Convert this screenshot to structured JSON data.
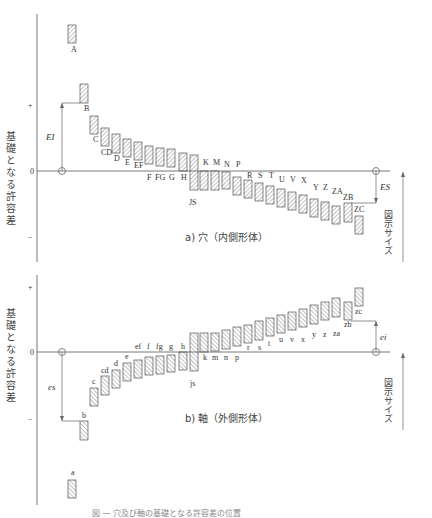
{
  "diagram": {
    "y_axis_label": "基礎となる許容差",
    "tick_plus": "+",
    "tick_zero": "0",
    "tick_minus": "−",
    "size_label": "図示サイズ",
    "caption": "図 — 穴及び軸の基礎となる許容差の位置"
  },
  "hole": {
    "title": "a) 穴（内側形体）",
    "EI": "EI",
    "ES": "ES",
    "bars": [
      {
        "label": "A",
        "x": 68,
        "y1": 25,
        "y2": 43,
        "lx": 71,
        "ly": 52
      },
      {
        "label": "B",
        "x": 80,
        "y1": 84,
        "y2": 103,
        "lx": 84,
        "ly": 111
      },
      {
        "label": "C",
        "x": 90,
        "y1": 116,
        "y2": 134,
        "lx": 93,
        "ly": 142
      },
      {
        "label": "CD",
        "x": 101,
        "y1": 128,
        "y2": 146,
        "lx": 101,
        "ly": 155
      },
      {
        "label": "D",
        "x": 112,
        "y1": 134,
        "y2": 153,
        "lx": 114,
        "ly": 161
      },
      {
        "label": "E",
        "x": 123,
        "y1": 139,
        "y2": 157,
        "lx": 125,
        "ly": 165
      },
      {
        "label": "EF",
        "x": 134,
        "y1": 142,
        "y2": 160,
        "lx": 134,
        "ly": 168
      },
      {
        "label": "F",
        "x": 145,
        "y1": 146,
        "y2": 164,
        "lx": 147,
        "ly": 180
      },
      {
        "label": "FG",
        "x": 156,
        "y1": 148,
        "y2": 166,
        "lx": 155,
        "ly": 180
      },
      {
        "label": "G",
        "x": 167,
        "y1": 149,
        "y2": 167,
        "lx": 169,
        "ly": 180
      },
      {
        "label": "H",
        "x": 179,
        "y1": 153,
        "y2": 171,
        "lx": 181,
        "ly": 180
      },
      {
        "label": "JS",
        "x": 190,
        "y1": 155,
        "y2": 190,
        "lx": 189,
        "ly": 205
      },
      {
        "label": "K",
        "x": 200,
        "y1": 171,
        "y2": 190,
        "lx": 203,
        "ly": 165
      },
      {
        "label": "M",
        "x": 211,
        "y1": 171,
        "y2": 190,
        "lx": 213,
        "ly": 165
      },
      {
        "label": "N",
        "x": 222,
        "y1": 172,
        "y2": 189,
        "lx": 224,
        "ly": 167
      },
      {
        "label": "P",
        "x": 233,
        "y1": 177,
        "y2": 195,
        "lx": 236,
        "ly": 167
      },
      {
        "label": "R",
        "x": 244,
        "y1": 180,
        "y2": 198,
        "lx": 247,
        "ly": 178
      },
      {
        "label": "S",
        "x": 255,
        "y1": 183,
        "y2": 201,
        "lx": 258,
        "ly": 178
      },
      {
        "label": "T",
        "x": 266,
        "y1": 186,
        "y2": 204,
        "lx": 269,
        "ly": 178
      },
      {
        "label": "U",
        "x": 277,
        "y1": 189,
        "y2": 207,
        "lx": 279,
        "ly": 182
      },
      {
        "label": "V",
        "x": 288,
        "y1": 192,
        "y2": 210,
        "lx": 290,
        "ly": 182
      },
      {
        "label": "X",
        "x": 299,
        "y1": 195,
        "y2": 213,
        "lx": 301,
        "ly": 183
      },
      {
        "label": "Y",
        "x": 310,
        "y1": 199,
        "y2": 217,
        "lx": 313,
        "ly": 190
      },
      {
        "label": "Z",
        "x": 321,
        "y1": 202,
        "y2": 220,
        "lx": 323,
        "ly": 190
      },
      {
        "label": "ZA",
        "x": 332,
        "y1": 206,
        "y2": 224,
        "lx": 332,
        "ly": 194
      },
      {
        "label": "ZB",
        "x": 344,
        "y1": 203,
        "y2": 222,
        "lx": 343,
        "ly": 200
      },
      {
        "label": "ZC",
        "x": 355,
        "y1": 216,
        "y2": 234,
        "lx": 354,
        "ly": 212
      }
    ]
  },
  "shaft": {
    "title": "b) 軸（外側形体）",
    "es": "es",
    "ei": "ei",
    "bars": [
      {
        "label": "a",
        "x": 68,
        "y1": 480,
        "y2": 498,
        "lx": 71,
        "ly": 475
      },
      {
        "label": "b",
        "x": 80,
        "y1": 421,
        "y2": 440,
        "lx": 82,
        "ly": 418
      },
      {
        "label": "c",
        "x": 90,
        "y1": 388,
        "y2": 406,
        "lx": 92,
        "ly": 384
      },
      {
        "label": "cd",
        "x": 101,
        "y1": 376,
        "y2": 395,
        "lx": 101,
        "ly": 373
      },
      {
        "label": "d",
        "x": 112,
        "y1": 370,
        "y2": 388,
        "lx": 114,
        "ly": 366
      },
      {
        "label": "e",
        "x": 123,
        "y1": 363,
        "y2": 381,
        "lx": 125,
        "ly": 359
      },
      {
        "label": "ef",
        "x": 134,
        "y1": 360,
        "y2": 378,
        "lx": 135,
        "ly": 349
      },
      {
        "label": "f",
        "x": 145,
        "y1": 357,
        "y2": 375,
        "lx": 147,
        "ly": 349
      },
      {
        "label": "fg",
        "x": 156,
        "y1": 356,
        "y2": 374,
        "lx": 156,
        "ly": 349
      },
      {
        "label": "g",
        "x": 167,
        "y1": 355,
        "y2": 372,
        "lx": 169,
        "ly": 349
      },
      {
        "label": "h",
        "x": 179,
        "y1": 352,
        "y2": 370,
        "lx": 181,
        "ly": 349
      },
      {
        "label": "js",
        "x": 190,
        "y1": 333,
        "y2": 371,
        "lx": 190,
        "ly": 386
      },
      {
        "label": "k",
        "x": 200,
        "y1": 333,
        "y2": 352,
        "lx": 203,
        "ly": 360
      },
      {
        "label": "m",
        "x": 211,
        "y1": 333,
        "y2": 351,
        "lx": 212,
        "ly": 360
      },
      {
        "label": "n",
        "x": 222,
        "y1": 330,
        "y2": 349,
        "lx": 224,
        "ly": 360
      },
      {
        "label": "p",
        "x": 233,
        "y1": 327,
        "y2": 346,
        "lx": 235,
        "ly": 360
      },
      {
        "label": "r",
        "x": 244,
        "y1": 325,
        "y2": 343,
        "lx": 247,
        "ly": 350
      },
      {
        "label": "s",
        "x": 255,
        "y1": 321,
        "y2": 340,
        "lx": 258,
        "ly": 350
      },
      {
        "label": "t",
        "x": 266,
        "y1": 318,
        "y2": 336,
        "lx": 268,
        "ly": 346
      },
      {
        "label": "u",
        "x": 277,
        "y1": 315,
        "y2": 333,
        "lx": 279,
        "ly": 342
      },
      {
        "label": "v",
        "x": 288,
        "y1": 312,
        "y2": 330,
        "lx": 290,
        "ly": 342
      },
      {
        "label": "x",
        "x": 299,
        "y1": 309,
        "y2": 327,
        "lx": 301,
        "ly": 342
      },
      {
        "label": "y",
        "x": 310,
        "y1": 305,
        "y2": 324,
        "lx": 312,
        "ly": 337
      },
      {
        "label": "z",
        "x": 321,
        "y1": 302,
        "y2": 320,
        "lx": 323,
        "ly": 337
      },
      {
        "label": "za",
        "x": 332,
        "y1": 298,
        "y2": 317,
        "lx": 333,
        "ly": 336
      },
      {
        "label": "zb",
        "x": 344,
        "y1": 302,
        "y2": 320,
        "lx": 344,
        "ly": 327
      },
      {
        "label": "zc",
        "x": 355,
        "y1": 288,
        "y2": 306,
        "lx": 355,
        "ly": 314
      }
    ]
  }
}
